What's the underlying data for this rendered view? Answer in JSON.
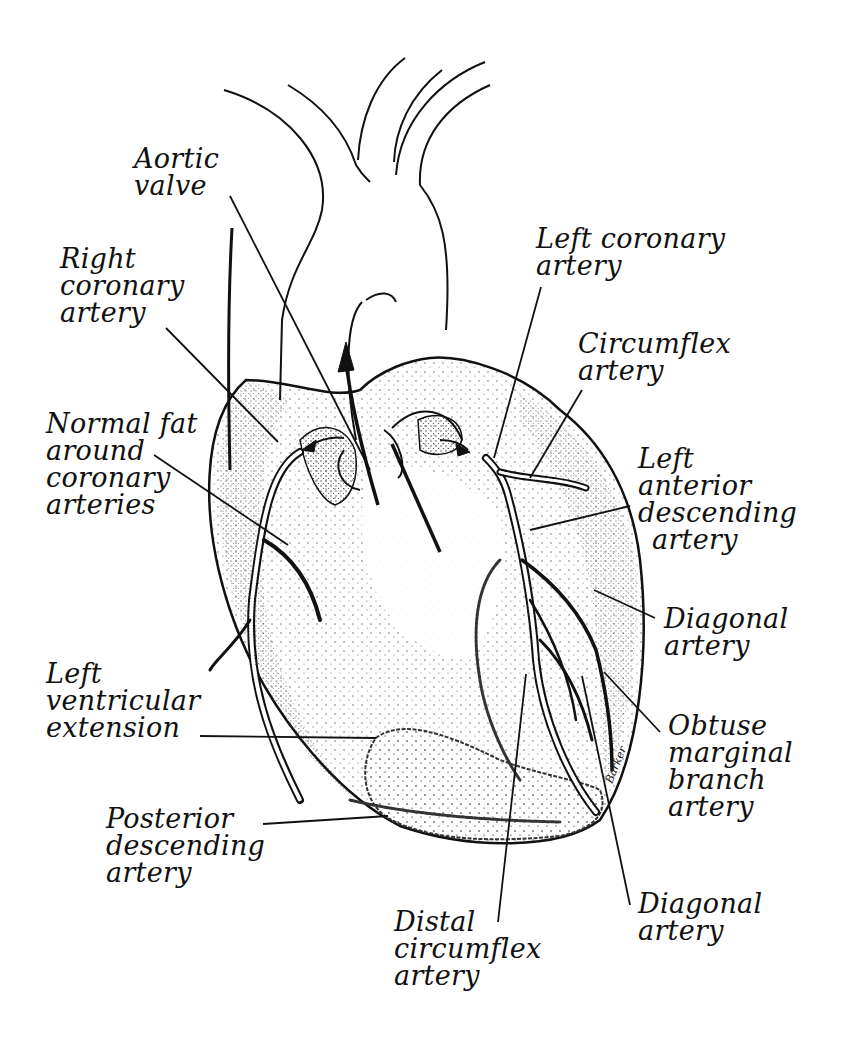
{
  "diagram": {
    "type": "anatomical-illustration",
    "signature": "Barker",
    "labels": [
      {
        "id": "aortic-valve",
        "lines": [
          "Aortic",
          "valve"
        ],
        "x": 134,
        "y": 145
      },
      {
        "id": "right-coronary-artery",
        "lines": [
          "Right",
          "coronary",
          "artery"
        ],
        "x": 60,
        "y": 245
      },
      {
        "id": "normal-fat",
        "lines": [
          "Normal fat",
          "around",
          "coronary",
          "arteries"
        ],
        "x": 46,
        "y": 410
      },
      {
        "id": "left-coronary-artery",
        "lines": [
          "Left coronary",
          "artery"
        ],
        "x": 536,
        "y": 225
      },
      {
        "id": "circumflex-artery",
        "lines": [
          "Circumflex",
          "artery"
        ],
        "x": 578,
        "y": 330
      },
      {
        "id": "left-anterior-descending-artery",
        "lines": [
          "Left",
          "anterior",
          "descending",
          "artery"
        ],
        "x": 638,
        "y": 445
      },
      {
        "id": "diagonal-artery-upper",
        "lines": [
          "Diagonal",
          "artery"
        ],
        "x": 664,
        "y": 605
      },
      {
        "id": "left-ventricular-extension",
        "lines": [
          "Left",
          "ventricular",
          "extension"
        ],
        "x": 46,
        "y": 660
      },
      {
        "id": "obtuse-marginal-branch-artery",
        "lines": [
          "Obtuse",
          "marginal",
          "branch",
          "artery"
        ],
        "x": 668,
        "y": 712
      },
      {
        "id": "posterior-descending-artery",
        "lines": [
          "Posterior",
          "descending",
          "artery"
        ],
        "x": 106,
        "y": 805
      },
      {
        "id": "diagonal-artery-lower",
        "lines": [
          "Diagonal",
          "artery"
        ],
        "x": 638,
        "y": 890
      },
      {
        "id": "distal-circumflex-artery",
        "lines": [
          "Distal",
          "circumflex",
          "artery"
        ],
        "x": 394,
        "y": 908
      }
    ],
    "leaders": [
      {
        "for": "aortic-valve",
        "x1": 230,
        "y1": 196,
        "x2": 370,
        "y2": 470
      },
      {
        "for": "right-coronary-artery",
        "x1": 166,
        "y1": 328,
        "x2": 278,
        "y2": 442
      },
      {
        "for": "normal-fat",
        "x1": 154,
        "y1": 455,
        "x2": 288,
        "y2": 545
      },
      {
        "for": "left-coronary-artery",
        "x1": 541,
        "y1": 287,
        "x2": 494,
        "y2": 458
      },
      {
        "for": "circumflex-artery",
        "x1": 582,
        "y1": 390,
        "x2": 530,
        "y2": 478
      },
      {
        "for": "left-anterior-descending-artery",
        "x1": 630,
        "y1": 506,
        "x2": 530,
        "y2": 530
      },
      {
        "for": "diagonal-artery-upper",
        "x1": 655,
        "y1": 618,
        "x2": 594,
        "y2": 590
      },
      {
        "for": "left-ventricular-extension",
        "x1": 200,
        "y1": 736,
        "x2": 376,
        "y2": 738
      },
      {
        "for": "obtuse-marginal-branch-artery",
        "x1": 660,
        "y1": 732,
        "x2": 604,
        "y2": 672
      },
      {
        "for": "posterior-descending-artery",
        "x1": 263,
        "y1": 824,
        "x2": 388,
        "y2": 816
      },
      {
        "for": "diagonal-artery-lower",
        "x1": 630,
        "y1": 905,
        "x2": 582,
        "y2": 676
      },
      {
        "for": "distal-circumflex-artery",
        "x1": 498,
        "y1": 922,
        "x2": 526,
        "y2": 674
      }
    ],
    "colors": {
      "ink": "#111111",
      "paper": "#ffffff",
      "stipple": "#555555"
    }
  }
}
